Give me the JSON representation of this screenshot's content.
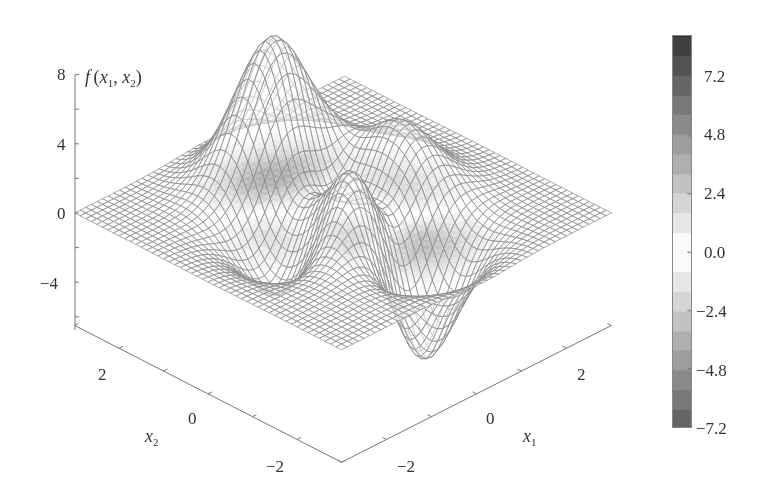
{
  "chart_data": {
    "type": "surface-mesh",
    "title": "",
    "function": "peaks(x1, x2) = 3(1-x1)^2 e^{-x1^2-(x2+1)^2} - 10(x1/5 - x1^3 - x2^5) e^{-x1^2-x2^2} - 1/3 e^{-(x1+1)^2-x2^2}",
    "xlabel": "x1",
    "ylabel": "x2",
    "zlabel": "f(x1, x2)",
    "xlim": [
      -3,
      3
    ],
    "ylim": [
      -3,
      3
    ],
    "zlim": [
      -6.5,
      8
    ],
    "x_ticks": [
      -2,
      0,
      2
    ],
    "y_ticks": [
      -2,
      0,
      2
    ],
    "z_ticks": [
      -4,
      0,
      4,
      8
    ],
    "colorbar": {
      "ticks": [
        7.2,
        4.8,
        2.4,
        0.0,
        -2.4,
        -4.8,
        -7.2
      ],
      "tick_labels": [
        "7.2",
        "4.8",
        "2.4",
        "0.0",
        "−2.4",
        "−4.8",
        "−7.2"
      ],
      "colormap": "gray-abs",
      "range": [
        -7.2,
        8.9
      ]
    },
    "features": [
      {
        "type": "max",
        "x1": 0.0,
        "x2": 1.58,
        "z": 8.1
      },
      {
        "type": "local_max",
        "x1": -0.46,
        "x2": -0.63,
        "z": 3.78
      },
      {
        "type": "local_max",
        "x1": 1.29,
        "x2": 0.0,
        "z": 3.59
      },
      {
        "type": "min",
        "x1": 0.23,
        "x2": -1.63,
        "z": -6.55
      },
      {
        "type": "local_min",
        "x1": -1.35,
        "x2": 0.2,
        "z": -3.05
      }
    ],
    "grid_resolution": 49,
    "contour_projection_on_base_plane": true
  },
  "axes": {
    "z_label": "f",
    "z_label_args": "(x",
    "z_sub1": "1",
    "z_comma": ", x",
    "z_sub2": "2",
    "z_close": ")",
    "x1_label": "x",
    "x1_sub": "1",
    "x2_label": "x",
    "x2_sub": "2",
    "z_ticks": [
      "8",
      "4",
      "0",
      "−4"
    ],
    "x1_ticks": [
      "−2",
      "0",
      "2"
    ],
    "x2_ticks": [
      "2",
      "0",
      "−2"
    ]
  },
  "colorbar": {
    "labels": [
      "7.2",
      "4.8",
      "2.4",
      "0.0",
      "−2.4",
      "−4.8",
      "−7.2"
    ]
  },
  "colors": {
    "mesh": "#8a8a8a",
    "axis": "#777777",
    "text": "#333333"
  }
}
